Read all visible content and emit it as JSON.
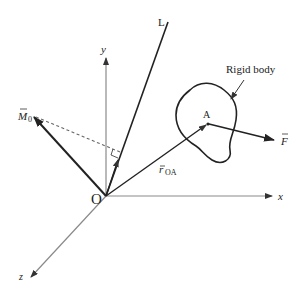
{
  "figure": {
    "type": "vector-mechanics-diagram"
  },
  "labels": {
    "origin": "O",
    "axis_x": "x",
    "axis_y": "y",
    "axis_z": "z",
    "axis_L": "L",
    "moment": "M",
    "moment_sub": "0",
    "position": "r",
    "position_sub": "OA",
    "point": "A",
    "force": "F",
    "body": "Rigid body"
  },
  "colors": {
    "axis": "#777777",
    "vector": "#222222",
    "dashed": "#555555",
    "text": "#222222",
    "background": "#ffffff"
  }
}
